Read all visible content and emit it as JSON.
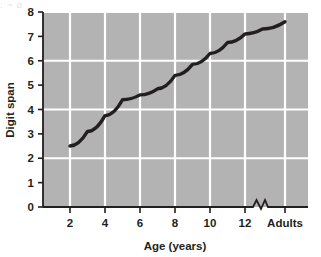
{
  "figure": {
    "plot_bg_color": "#b3b3b3",
    "grid_color": "#ffffff",
    "axis_color": "#231f20",
    "line_color": "#231f20",
    "top_clipped_text": "; ~ g"
  },
  "chart_data": {
    "type": "line",
    "title": "",
    "xlabel": "Age (years)",
    "ylabel": "Digit span",
    "grid": true,
    "grid_axis": "both",
    "legend": false,
    "axis_break": {
      "present": true,
      "between": [
        "12",
        "Adults"
      ],
      "marker": "zigzag"
    },
    "ylim": [
      0,
      8
    ],
    "yticks": [
      0,
      1,
      2,
      3,
      4,
      5,
      6,
      7,
      8
    ],
    "ytick_labels": [
      "0",
      "1",
      "2",
      "3",
      "4",
      "5",
      "6",
      "7",
      "8"
    ],
    "ygridlines": [
      2,
      4,
      6,
      8
    ],
    "xtick_labels": [
      "2",
      "4",
      "6",
      "8",
      "10",
      "12",
      "Adults"
    ],
    "xtick_values": [
      2,
      4,
      6,
      8,
      10,
      12,
      15
    ],
    "series": [
      {
        "name": "Digit span by age",
        "x": [
          2,
          3,
          4,
          5,
          6,
          7,
          8,
          9,
          10,
          11,
          12,
          13,
          15
        ],
        "y": [
          2.5,
          3.1,
          3.75,
          4.4,
          4.6,
          4.85,
          5.4,
          5.85,
          6.3,
          6.75,
          7.1,
          7.3,
          7.6
        ]
      }
    ]
  }
}
